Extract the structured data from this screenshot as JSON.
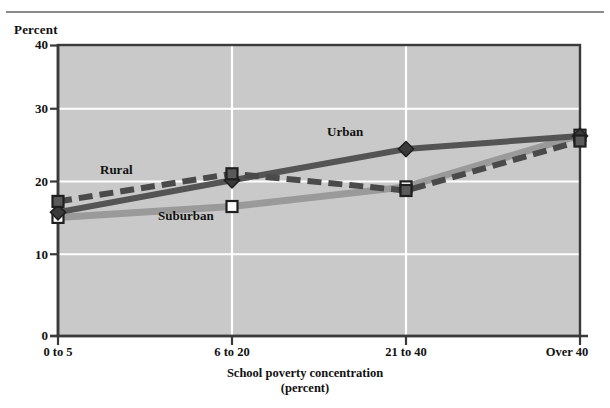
{
  "chart_data": {
    "type": "line",
    "title": "",
    "ylabel": "Percent",
    "xlabel": "School poverty concentration",
    "xlabel_sub": "(percent)",
    "categories": [
      "0 to 5",
      "6 to 20",
      "21 to 40",
      "Over 40"
    ],
    "ylim": [
      0,
      40
    ],
    "yticks": [
      0,
      10,
      20,
      30,
      40
    ],
    "ytick_labels": [
      "0",
      "10",
      "20",
      "30",
      "40"
    ],
    "grid": "white horizontal and vertical gridlines on gray plot background",
    "legend_position": "inline labels on plot",
    "series": [
      {
        "name": "Rural",
        "values": [
          18.5,
          22.3,
          20.0,
          26.8
        ],
        "style": "dashed",
        "marker": "filled-square",
        "color": "#4a4a4a"
      },
      {
        "name": "Urban",
        "values": [
          17.0,
          21.4,
          25.7,
          27.5
        ],
        "style": "solid",
        "marker": "filled-diamond",
        "color": "#545454"
      },
      {
        "name": "Suburban",
        "values": [
          16.3,
          17.8,
          20.5,
          27.6
        ],
        "style": "solid",
        "marker": "open-square",
        "color": "#9a9a9a"
      }
    ],
    "annotations": [
      {
        "text": "Rural",
        "x": 100,
        "y": 170
      },
      {
        "text": "Urban",
        "x": 327,
        "y": 132
      },
      {
        "text": "Suburban",
        "x": 158,
        "y": 216
      }
    ],
    "colors": {
      "plot_background": "#c9c9c9",
      "gridline": "#ffffff",
      "axis": "#3a3a3a",
      "rural": "#4a4a4a",
      "urban": "#545454",
      "suburban": "#9a9a9a"
    }
  }
}
